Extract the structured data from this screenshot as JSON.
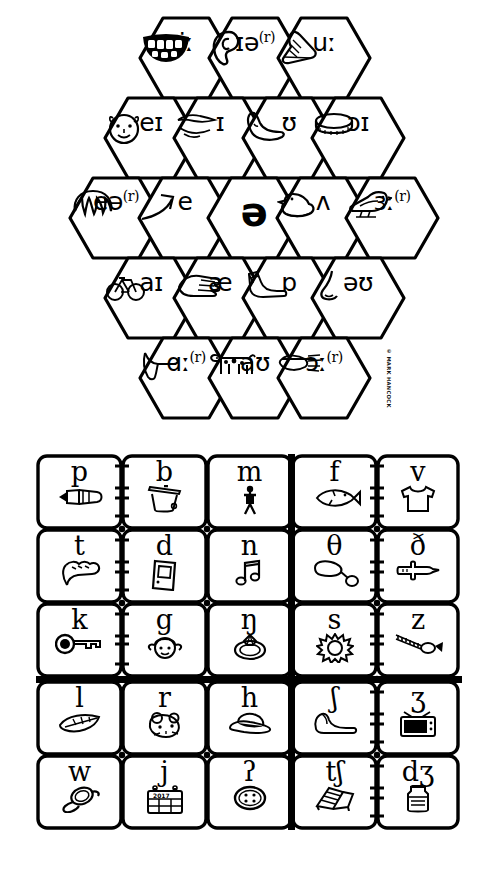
{
  "credit": "© MARK HANCOCK",
  "colors": {
    "ink": "#000000",
    "paper": "#ffffff"
  },
  "vowel_chart": {
    "name": "vowel-honeycomb",
    "shape": "hexagon-grid",
    "rows": [
      {
        "row": 1,
        "cells": [
          {
            "symbol": "iː",
            "picture": "teeth-smile-icon",
            "sup": ""
          },
          {
            "symbol": "ɪə",
            "picture": "ear-icon",
            "sup": "(r)"
          },
          {
            "symbol": "uː",
            "picture": "shoe-icon",
            "sup": ""
          }
        ]
      },
      {
        "row": 2,
        "cells": [
          {
            "symbol": "eɪ",
            "picture": "face-icon",
            "sup": ""
          },
          {
            "symbol": "ɪ",
            "picture": "lips-icon",
            "sup": ""
          },
          {
            "symbol": "ʊ",
            "picture": "foot-icon",
            "sup": ""
          },
          {
            "symbol": "ɔɪ",
            "picture": "coin-icon",
            "sup": ""
          }
        ]
      },
      {
        "row": 3,
        "cells": [
          {
            "symbol": "eə",
            "picture": "hair-icon",
            "sup": "(r)"
          },
          {
            "symbol": "e",
            "picture": "arrow-icon",
            "sup": ""
          },
          {
            "symbol": "ə",
            "picture": "",
            "sup": ""
          },
          {
            "symbol": "ʌ",
            "picture": "duck-icon",
            "sup": ""
          },
          {
            "symbol": "ɜː",
            "picture": "bird-icon",
            "sup": "(r)"
          }
        ]
      },
      {
        "row": 4,
        "cells": [
          {
            "symbol": "aɪ",
            "picture": "bicycle-icon",
            "sup": ""
          },
          {
            "symbol": "æ",
            "picture": "hand-icon",
            "sup": ""
          },
          {
            "symbol": "ɒ",
            "picture": "sock-icon",
            "sup": ""
          },
          {
            "symbol": "əʊ",
            "picture": "nose-icon",
            "sup": ""
          }
        ]
      },
      {
        "row": 5,
        "cells": [
          {
            "symbol": "ɑː",
            "picture": "arm-icon",
            "sup": "(r)"
          },
          {
            "symbol": "aʊ",
            "picture": "cow-icon",
            "sup": ""
          },
          {
            "symbol": "ɔː",
            "picture": "fork-icon",
            "sup": "(r)"
          }
        ]
      }
    ]
  },
  "consonant_chart": {
    "name": "consonant-grid",
    "columns": 5,
    "rows": 5,
    "rows_data": [
      [
        {
          "symbol": "p",
          "picture": "pen-icon"
        },
        {
          "symbol": "b",
          "picture": "bin-icon"
        },
        {
          "symbol": "m",
          "picture": "man-icon"
        },
        {
          "symbol": "f",
          "picture": "fish-icon"
        },
        {
          "symbol": "v",
          "picture": "vest-icon"
        }
      ],
      [
        {
          "symbol": "t",
          "picture": "toe-icon"
        },
        {
          "symbol": "d",
          "picture": "door-icon"
        },
        {
          "symbol": "n",
          "picture": "note-icon"
        },
        {
          "symbol": "θ",
          "picture": "thermometer-icon"
        },
        {
          "symbol": "ð",
          "picture": "pointing-hand-icon"
        }
      ],
      [
        {
          "symbol": "k",
          "picture": "key-icon"
        },
        {
          "symbol": "g",
          "picture": "girl-icon"
        },
        {
          "symbol": "ŋ",
          "picture": "ring-icon"
        },
        {
          "symbol": "s",
          "picture": "sun-icon"
        },
        {
          "symbol": "z",
          "picture": "zip-icon"
        }
      ],
      [
        {
          "symbol": "l",
          "picture": "leaf-icon"
        },
        {
          "symbol": "r",
          "picture": "rat-icon"
        },
        {
          "symbol": "h",
          "picture": "hat-icon"
        },
        {
          "symbol": "ʃ",
          "picture": "shoe-icon"
        },
        {
          "symbol": "ʒ",
          "picture": "television-icon"
        }
      ],
      [
        {
          "symbol": "w",
          "picture": "watch-icon"
        },
        {
          "symbol": "j",
          "picture": "calendar-icon",
          "picture_text": "2017"
        },
        {
          "symbol": "ʔ",
          "picture": "button-icon"
        },
        {
          "symbol": "tʃ",
          "picture": "chair-icon"
        },
        {
          "symbol": "dʒ",
          "picture": "jam-jar-icon"
        }
      ]
    ]
  }
}
